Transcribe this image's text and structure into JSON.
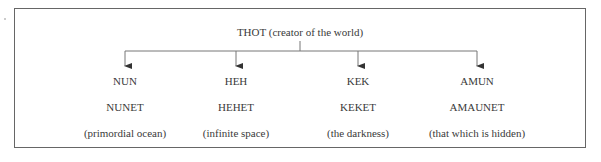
{
  "diagram": {
    "root": {
      "label": "THOT (creator of the world)",
      "x": 300
    },
    "children": [
      {
        "name": "NUN",
        "consort": "NUNET",
        "meaning": "(primordial ocean)",
        "x": 125
      },
      {
        "name": "HEH",
        "consort": "HEHET",
        "meaning": "(infinite space)",
        "x": 236
      },
      {
        "name": "KEK",
        "consort": "KEKET",
        "meaning": "(the darkness)",
        "x": 358
      },
      {
        "name": "AMUN",
        "consort": "AMAUNET",
        "meaning": "(that which is hidden)",
        "x": 477
      }
    ],
    "colors": {
      "line": "#777777",
      "text": "#3a3a3a",
      "border": "#666666"
    }
  }
}
